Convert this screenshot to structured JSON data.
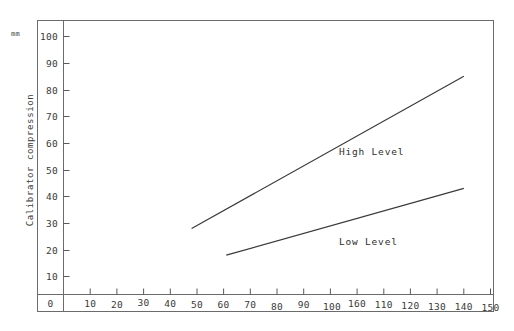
{
  "chart_data": {
    "type": "line",
    "title": "",
    "xlabel": "",
    "ylabel": "Calibrator compression",
    "yunit": "mm",
    "xlim": [
      0,
      160
    ],
    "ylim": [
      0,
      105
    ],
    "xticks": [
      0,
      10,
      20,
      30,
      40,
      50,
      60,
      70,
      80,
      90,
      100,
      110,
      120,
      130,
      140,
      150,
      160
    ],
    "yticks": [
      10,
      20,
      30,
      40,
      50,
      60,
      70,
      80,
      90,
      100
    ],
    "grid": false,
    "legend_position": "inline-annotation",
    "series": [
      {
        "name": "High Level",
        "label": "High Level",
        "x": [
          48,
          150
        ],
        "values": [
          28,
          85
        ],
        "color": "#3a3a3a"
      },
      {
        "name": "Low Level",
        "label": "Low Level",
        "x": [
          61,
          150
        ],
        "values": [
          18,
          43
        ],
        "color": "#3a3a3a"
      }
    ],
    "annotations": [
      {
        "text": "High Level",
        "x": 104,
        "y": 57
      },
      {
        "text": "Low Level",
        "x": 104,
        "y": 23
      }
    ]
  },
  "axes": {
    "unit_label": "mm",
    "y_title": "Calibrator compression",
    "x_tick_labels": [
      "0",
      "10",
      "20",
      "30",
      "40",
      "50",
      "60",
      "70",
      "80",
      "90",
      "100",
      "110",
      "120",
      "130",
      "140",
      "150",
      "160"
    ],
    "y_tick_labels": [
      "100",
      "90",
      "80",
      "70",
      "60",
      "50",
      "40",
      "30",
      "20",
      "10"
    ]
  },
  "style": {
    "axis_color": "#555555",
    "line_color": "#3a3a3a",
    "text_color": "#3a3a3a",
    "background": "#ffffff"
  }
}
